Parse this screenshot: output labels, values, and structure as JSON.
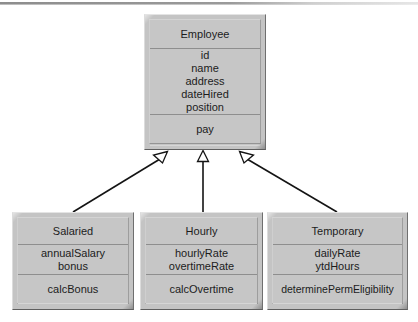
{
  "diagram": {
    "type": "uml-class-diagram",
    "relationship": "generalization",
    "superclass": {
      "name": "Employee",
      "attributes": [
        "id",
        "name",
        "address",
        "dateHired",
        "position"
      ],
      "operations": [
        "pay"
      ]
    },
    "subclasses": [
      {
        "name": "Salaried",
        "attributes": [
          "annualSalary",
          "bonus"
        ],
        "operations": [
          "calcBonus"
        ]
      },
      {
        "name": "Hourly",
        "attributes": [
          "hourlyRate",
          "overtimeRate"
        ],
        "operations": [
          "calcOvertime"
        ]
      },
      {
        "name": "Temporary",
        "attributes": [
          "dailyRate",
          "ytdHours"
        ],
        "operations": [
          "determinePermEligibility"
        ]
      }
    ],
    "colors": {
      "box_fill": "#c6c6c6",
      "box_shadow": "#5f5f5f",
      "box_highlight": "#e4e4e4",
      "line": "#141414",
      "arrow_fill": "#ffffff",
      "background": "#ffffff",
      "divider": "#8e8e8e"
    }
  }
}
